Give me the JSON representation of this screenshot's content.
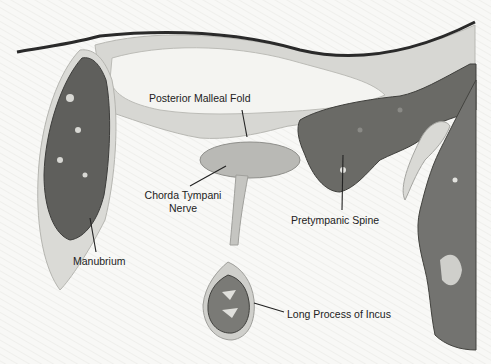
{
  "figure": {
    "colors": {
      "background": "#f7f7f5",
      "light_tissue": "#d6d6d2",
      "mid_tissue": "#a9a9a5",
      "dark_bone": "#5d5d5a",
      "epithelium": "#2a2a2a",
      "label_text": "#222222"
    }
  },
  "labels": {
    "posterior_malleal_fold": "Posterior Malleal Fold",
    "chorda_tympani_line1": "Chorda Tympani",
    "chorda_tympani_line2": "Nerve",
    "pretympanic_spine": "Pretympanic Spine",
    "manubrium": "Manubrium",
    "long_process_of_incus": "Long Process of Incus"
  }
}
